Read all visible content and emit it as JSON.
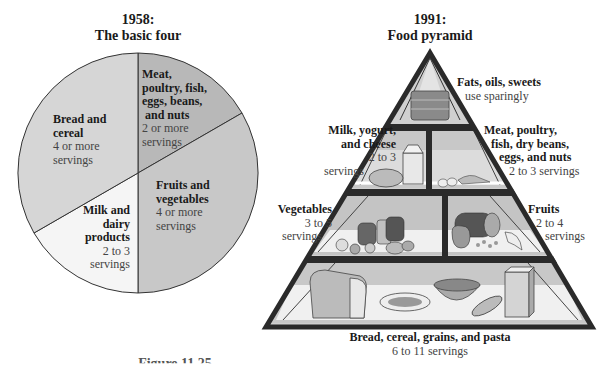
{
  "left_panel": {
    "title_line1": "1958:",
    "title_line2": "The basic four",
    "segments": [
      {
        "name_lines": [
          "Meat,",
          "poultry, fish,",
          "eggs, beans,",
          " and nuts"
        ],
        "servings_lines": [
          "2 or more",
          "servings"
        ],
        "fill": "#b9b9b9"
      },
      {
        "name_lines": [
          "Bread and",
          "cereal"
        ],
        "servings_lines": [
          "4 or more",
          "servings"
        ],
        "fill": "#d6d6d6"
      },
      {
        "name_lines": [
          "Milk and",
          "dairy",
          "products"
        ],
        "servings_lines": [
          "2 to 3",
          "servings"
        ],
        "fill": "#f4f4f4"
      },
      {
        "name_lines": [
          "Fruits and",
          "vegetables"
        ],
        "servings_lines": [
          "4 or more",
          "servings"
        ],
        "fill": "#c9c9c9"
      }
    ]
  },
  "right_panel": {
    "title_line1": "1991:",
    "title_line2": "Food pyramid",
    "groups": [
      {
        "name_lines": [
          "Fats, oils, sweets"
        ],
        "servings_lines": [
          "use sparingly"
        ]
      },
      {
        "name_lines": [
          "Milk, yogurt,",
          "and cheese"
        ],
        "servings_lines": [
          "2 to 3",
          "servings"
        ]
      },
      {
        "name_lines": [
          "Meat, poultry,",
          "fish, dry beans,",
          "eggs, and nuts"
        ],
        "servings_lines": [
          "2 to 3 servings"
        ]
      },
      {
        "name_lines": [
          "Vegetables"
        ],
        "servings_lines": [
          "3 to 5",
          "servings"
        ]
      },
      {
        "name_lines": [
          "Fruits"
        ],
        "servings_lines": [
          "2 to 4",
          "servings"
        ]
      },
      {
        "name_lines": [
          "Bread, cereal, grains, and pasta"
        ],
        "servings_lines": [
          "6 to 11 servings"
        ]
      }
    ]
  },
  "caption_partial": "Figure 11.25"
}
